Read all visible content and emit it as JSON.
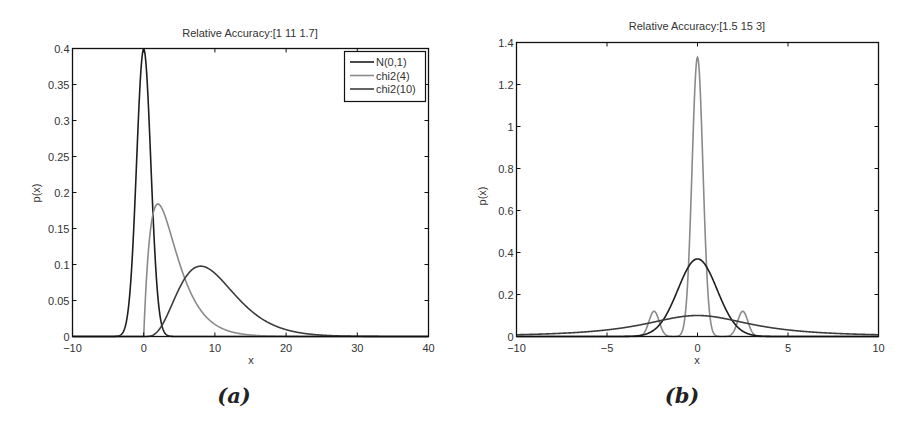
{
  "chart_data": [
    {
      "id": "a",
      "type": "line",
      "caption": "(a)",
      "title": "Relative Accuracy:[1 11 1.7]",
      "xlabel": "x",
      "ylabel": "p(x)",
      "xlim": [
        -10,
        40
      ],
      "ylim": [
        0,
        0.4
      ],
      "xticks": [
        -10,
        0,
        10,
        20,
        30,
        40
      ],
      "xtick_labels": [
        "−10",
        "0",
        "10",
        "20",
        "30",
        "40"
      ],
      "yticks": [
        0,
        0.05,
        0.1,
        0.15,
        0.2,
        0.25,
        0.3,
        0.35,
        0.4
      ],
      "ytick_labels": [
        "0",
        "0.05",
        "0.1",
        "0.15",
        "0.2",
        "0.25",
        "0.3",
        "0.35",
        "0.4"
      ],
      "grid": false,
      "legend_position": "upper right",
      "series": [
        {
          "name": "N(0,1)",
          "color": "#1e1e1e",
          "dist": "normal",
          "params": {
            "mu": 0,
            "sigma": 1
          },
          "peak": [
            0,
            0.399
          ]
        },
        {
          "name": "chi2(4)",
          "color": "#8a8a8a",
          "dist": "chi2",
          "params": {
            "k": 4
          },
          "peak": [
            2,
            0.184
          ]
        },
        {
          "name": "chi2(10)",
          "color": "#3c3c3c",
          "dist": "chi2",
          "params": {
            "k": 10
          },
          "peak": [
            8,
            0.098
          ]
        }
      ]
    },
    {
      "id": "b",
      "type": "line",
      "caption": "(b)",
      "title": "Relative Accuracy:[1.5 15 3]",
      "xlabel": "x",
      "ylabel": "p(x)",
      "xlim": [
        -10,
        10
      ],
      "ylim": [
        0,
        1.4
      ],
      "xticks": [
        -10,
        -5,
        0,
        5,
        10
      ],
      "xtick_labels": [
        "−10",
        "−5",
        "0",
        "5",
        "10"
      ],
      "yticks": [
        0,
        0.2,
        0.4,
        0.6,
        0.8,
        1,
        1.2,
        1.4
      ],
      "ytick_labels": [
        "0",
        "0.2",
        "0.4",
        "0.6",
        "0.8",
        "1",
        "1.2",
        "1.4"
      ],
      "grid": false,
      "legend_position": "none",
      "series": [
        {
          "name": "narrow mixture",
          "color": "#8a8a8a",
          "dist": "mixture",
          "components": [
            {
              "w": 1.0,
              "mu": 0,
              "sigma": 0.3,
              "scale": 1.33
            },
            {
              "w": 1.0,
              "mu": -2.4,
              "sigma": 0.28,
              "scale": 0.12
            },
            {
              "w": 1.0,
              "mu": 2.5,
              "sigma": 0.28,
              "scale": 0.12
            }
          ],
          "peak": [
            0,
            1.33
          ]
        },
        {
          "name": "gaussian",
          "color": "#1e1e1e",
          "dist": "normal",
          "params": {
            "mu": 0,
            "sigma": 1.08
          },
          "peak": [
            0,
            0.37
          ]
        },
        {
          "name": "heavy-tailed",
          "color": "#3c3c3c",
          "dist": "student_t",
          "params": {
            "nu": 1.6,
            "scale": 3.3,
            "peak": 0.1
          },
          "peak": [
            0,
            0.1
          ]
        }
      ]
    }
  ]
}
